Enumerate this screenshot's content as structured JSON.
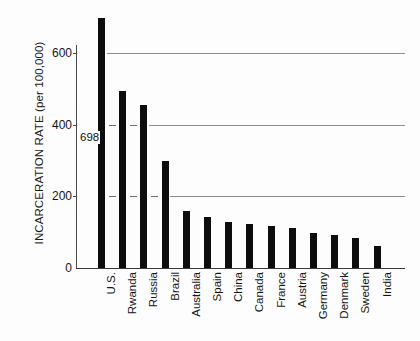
{
  "chart_data": {
    "type": "bar",
    "title": "",
    "xlabel": "",
    "ylabel": "INCARCERATION RATE (per 100,000)",
    "ylim": [
      0,
      720
    ],
    "yticks": [
      0,
      200,
      400,
      600
    ],
    "ytick_labels": [
      "0",
      "200",
      "400",
      "600"
    ],
    "gridlines": [
      200,
      400,
      600
    ],
    "grid": true,
    "legend": "none",
    "orientation": "vertical",
    "bar_color": "#0d0d0d",
    "categories": [
      "U.S.",
      "Rwanda",
      "Russia",
      "Brazil",
      "Australia",
      "Spain",
      "China",
      "Canada",
      "France",
      "Austria",
      "Germany",
      "Denmark",
      "Sweden",
      "India"
    ],
    "values": [
      698,
      495,
      455,
      300,
      160,
      143,
      128,
      122,
      117,
      112,
      98,
      91,
      85,
      62
    ],
    "annotations": [
      {
        "text": "698",
        "category": "U.S.",
        "value": 698,
        "placement": "left-of-bar"
      }
    ]
  },
  "axis": {
    "y_title": "INCARCERATION RATE (per 100,000)",
    "ticks": [
      {
        "label": "600",
        "value": 600
      },
      {
        "label": "400",
        "value": 400
      },
      {
        "label": "200",
        "value": 200
      },
      {
        "label": "0",
        "value": 0
      }
    ]
  }
}
